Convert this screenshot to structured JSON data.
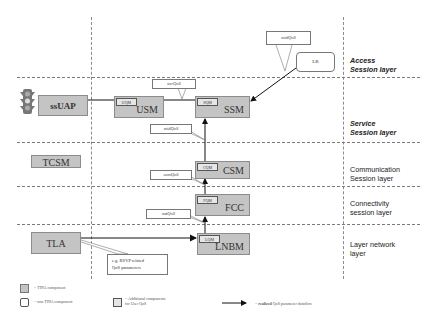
{
  "layers": [
    {
      "id": "access",
      "line1": "Access",
      "line2": "Session layer",
      "italic": true
    },
    {
      "id": "service",
      "line1": "Service",
      "line2": "Session layer",
      "italic": true
    },
    {
      "id": "communication",
      "line1": "Communication",
      "line2": "Session layer",
      "italic": false
    },
    {
      "id": "connectivity",
      "line1": "Connectivity",
      "line2": "session layer",
      "italic": false
    },
    {
      "id": "layer-network",
      "line1": "Layer network",
      "line2": "layer",
      "italic": false
    }
  ],
  "components": {
    "ssuap": {
      "name": "ssUAP"
    },
    "usm": {
      "name": "USM",
      "sub": "UQM"
    },
    "ssm": {
      "name": "SSM",
      "sub": "SQM"
    },
    "lb": {
      "name": "LB"
    },
    "tcsm": {
      "name": "TCSM"
    },
    "csm": {
      "name": "CSM",
      "sub": "CQM"
    },
    "fcc": {
      "name": "FCC",
      "sub": "FQM"
    },
    "tla": {
      "name": "TLA"
    },
    "lnbm": {
      "name": "LNBM",
      "sub": "LQM"
    }
  },
  "callouts": {
    "mid_qos_top": "midQoS",
    "usr_qos": "usrQoS",
    "mid_qos": "midQoS",
    "com_qos": "comQoS",
    "net_qos": "netQoS",
    "rsvp_line1": "e.g. RSVP related",
    "rsvp_line2": "QoS parameters"
  },
  "legend": {
    "tina": "= TINA component",
    "non_tina": "= non TINA component",
    "additional_line1": "= Additional components",
    "additional_line2": "for User QoS",
    "dataflow_bold": "realized",
    "dataflow_prefix": "= ",
    "dataflow_rest": " QoS parameter dataflow"
  },
  "colors": {
    "tina_fill": "#c4c4c4",
    "additional_fill": "#e6e6e6",
    "arrow": "#111111",
    "dash": "#7a7a7a"
  }
}
